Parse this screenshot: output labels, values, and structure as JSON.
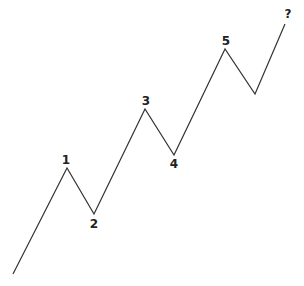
{
  "diagram": {
    "title": "",
    "type": "elliott-wave",
    "line_color": "#333333",
    "label_color": "#222222",
    "background": "#ffffff",
    "points": [
      {
        "x": 13,
        "y": 274
      },
      {
        "x": 67,
        "y": 168
      },
      {
        "x": 94,
        "y": 214
      },
      {
        "x": 145,
        "y": 109
      },
      {
        "x": 174,
        "y": 155
      },
      {
        "x": 225,
        "y": 49
      },
      {
        "x": 255,
        "y": 94
      },
      {
        "x": 285,
        "y": 24
      }
    ],
    "labels": [
      {
        "text": "1",
        "x": 66,
        "y": 164
      },
      {
        "text": "2",
        "x": 94,
        "y": 228
      },
      {
        "text": "3",
        "x": 146,
        "y": 105
      },
      {
        "text": "4",
        "x": 174,
        "y": 168
      },
      {
        "text": "5",
        "x": 226,
        "y": 45
      },
      {
        "text": "?",
        "x": 288,
        "y": 18
      }
    ]
  }
}
